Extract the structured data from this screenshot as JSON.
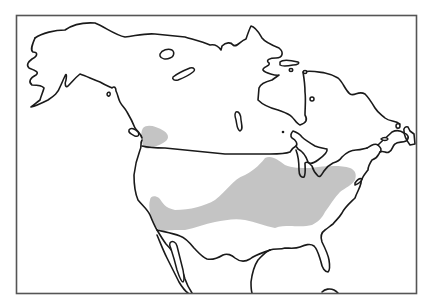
{
  "map": {
    "title": "Species distribution range map of North America",
    "region": "North America",
    "range_fill_color": "#c4c4c4",
    "coast_color": "#1a1a1a",
    "frame_color": "#555555",
    "background_color": "#ffffff",
    "range_areas": [
      {
        "name": "Pacific Northwest patch",
        "description": "small patch around Puget Sound / Vancouver Island area"
      },
      {
        "name": "Main eastern range",
        "description": "broad band from the southwest and central US through Midwest to New England coast"
      }
    ]
  }
}
